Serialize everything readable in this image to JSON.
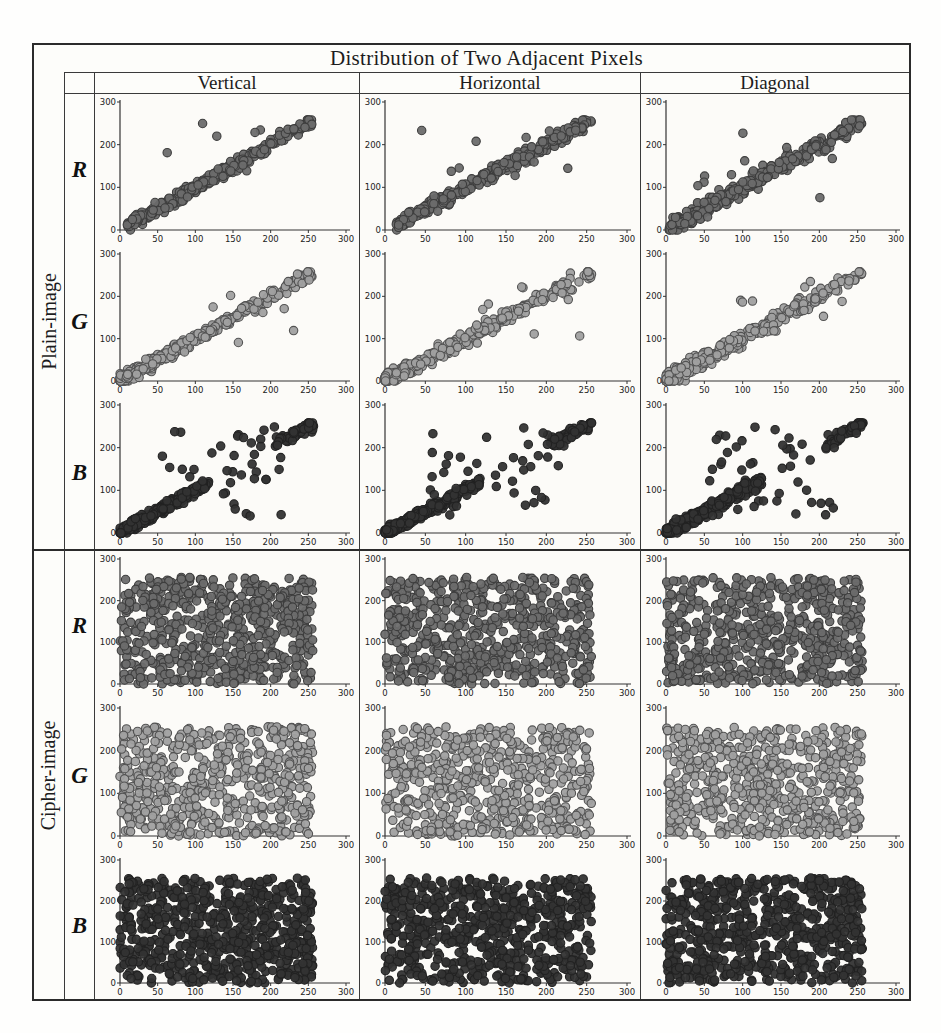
{
  "figure": {
    "title": "Distribution of Two Adjacent Pixels",
    "col_headers": [
      "Vertical",
      "Horizontal",
      "Diagonal"
    ],
    "row_groups": [
      {
        "label": "Plain-image",
        "channels": [
          "R",
          "G",
          "B"
        ]
      },
      {
        "label": "Cipher-image",
        "channels": [
          "R",
          "G",
          "B"
        ]
      }
    ]
  },
  "colors": {
    "R": {
      "fill": "#6b6b6b",
      "stroke": "#3d3d3d"
    },
    "G": {
      "fill": "#a0a0a0",
      "stroke": "#525252"
    },
    "B": {
      "fill": "#333333",
      "stroke": "#222222"
    },
    "axis": "#333333",
    "plot_bg": "#fcfbf8",
    "table_border": "#2b2b2b"
  },
  "chart_data": {
    "type": "scatter",
    "title": "Distribution of Two Adjacent Pixels",
    "xlabel": "",
    "ylabel": "",
    "xlim": [
      0,
      300
    ],
    "ylim": [
      0,
      300
    ],
    "xticks": [
      0,
      50,
      100,
      150,
      200,
      250,
      300
    ],
    "yticks": [
      0,
      100,
      200,
      300
    ],
    "data_value_range": [
      0,
      255
    ],
    "grid": false,
    "legend": "none",
    "marker_radius": 4.2,
    "layout": "6 rows (Plain-image R/G/B, Cipher-image R/G/B) x 3 columns (Vertical, Horizontal, Diagonal)",
    "subplots": [
      {
        "id": "plain-R-vertical",
        "group": "Plain-image",
        "channel": "R",
        "direction": "Vertical",
        "seed": 101,
        "components": [
          {
            "kind": "diag",
            "n": 310,
            "x0": 8,
            "x1": 256,
            "skew": 1.1,
            "sigma": 13
          },
          {
            "kind": "uniform",
            "n": 7,
            "x0": 40,
            "x1": 235,
            "y0": 80,
            "y1": 250
          }
        ]
      },
      {
        "id": "plain-R-horizontal",
        "group": "Plain-image",
        "channel": "R",
        "direction": "Horizontal",
        "seed": 102,
        "components": [
          {
            "kind": "diag",
            "n": 310,
            "x0": 14,
            "x1": 256,
            "skew": 1.1,
            "sigma": 14
          },
          {
            "kind": "uniform",
            "n": 10,
            "x0": 45,
            "x1": 240,
            "y0": 85,
            "y1": 255
          }
        ]
      },
      {
        "id": "plain-R-diagonal",
        "group": "Plain-image",
        "channel": "R",
        "direction": "Diagonal",
        "seed": 103,
        "components": [
          {
            "kind": "diag",
            "n": 320,
            "x0": 4,
            "x1": 256,
            "skew": 1.1,
            "sigma": 16
          },
          {
            "kind": "uniform",
            "n": 12,
            "x0": 30,
            "x1": 240,
            "y0": 60,
            "y1": 255
          }
        ]
      },
      {
        "id": "plain-G-vertical",
        "group": "Plain-image",
        "channel": "G",
        "direction": "Vertical",
        "seed": 104,
        "components": [
          {
            "kind": "diag",
            "n": 350,
            "x0": 0,
            "x1": 256,
            "skew": 1.85,
            "sigma": 13
          },
          {
            "kind": "uniform",
            "n": 7,
            "x0": 110,
            "x1": 245,
            "y0": 90,
            "y1": 235
          }
        ]
      },
      {
        "id": "plain-G-horizontal",
        "group": "Plain-image",
        "channel": "G",
        "direction": "Horizontal",
        "seed": 105,
        "components": [
          {
            "kind": "diag",
            "n": 350,
            "x0": 0,
            "x1": 256,
            "skew": 1.85,
            "sigma": 14
          },
          {
            "kind": "uniform",
            "n": 8,
            "x0": 100,
            "x1": 245,
            "y0": 90,
            "y1": 240
          }
        ]
      },
      {
        "id": "plain-G-diagonal",
        "group": "Plain-image",
        "channel": "G",
        "direction": "Diagonal",
        "seed": 106,
        "components": [
          {
            "kind": "diag",
            "n": 360,
            "x0": 0,
            "x1": 256,
            "skew": 1.85,
            "sigma": 16
          },
          {
            "kind": "uniform",
            "n": 10,
            "x0": 90,
            "x1": 245,
            "y0": 80,
            "y1": 240
          }
        ]
      },
      {
        "id": "plain-B-vertical",
        "group": "Plain-image",
        "channel": "B",
        "direction": "Vertical",
        "seed": 107,
        "components": [
          {
            "kind": "diag",
            "n": 300,
            "x0": 0,
            "x1": 118,
            "skew": 1.5,
            "sigma": 10
          },
          {
            "kind": "diag",
            "n": 55,
            "x0": 205,
            "x1": 257,
            "skew": 0.9,
            "sigma": 13
          },
          {
            "kind": "uniform",
            "n": 42,
            "x0": 55,
            "x1": 215,
            "y0": 40,
            "y1": 250
          }
        ]
      },
      {
        "id": "plain-B-horizontal",
        "group": "Plain-image",
        "channel": "B",
        "direction": "Horizontal",
        "seed": 108,
        "components": [
          {
            "kind": "diag",
            "n": 300,
            "x0": 0,
            "x1": 118,
            "skew": 1.5,
            "sigma": 10
          },
          {
            "kind": "diag",
            "n": 55,
            "x0": 205,
            "x1": 257,
            "skew": 0.9,
            "sigma": 13
          },
          {
            "kind": "uniform",
            "n": 40,
            "x0": 55,
            "x1": 215,
            "y0": 40,
            "y1": 250
          }
        ]
      },
      {
        "id": "plain-B-diagonal",
        "group": "Plain-image",
        "channel": "B",
        "direction": "Diagonal",
        "seed": 109,
        "components": [
          {
            "kind": "diag",
            "n": 320,
            "x0": 0,
            "x1": 125,
            "skew": 1.5,
            "sigma": 12
          },
          {
            "kind": "diag",
            "n": 55,
            "x0": 205,
            "x1": 257,
            "skew": 0.9,
            "sigma": 13
          },
          {
            "kind": "uniform",
            "n": 44,
            "x0": 55,
            "x1": 220,
            "y0": 40,
            "y1": 250
          }
        ]
      },
      {
        "id": "cipher-R-vertical",
        "group": "Cipher-image",
        "channel": "R",
        "direction": "Vertical",
        "seed": 110,
        "components": [
          {
            "kind": "uniform",
            "n": 620,
            "x0": 0,
            "x1": 256,
            "y0": 0,
            "y1": 256
          }
        ]
      },
      {
        "id": "cipher-R-horizontal",
        "group": "Cipher-image",
        "channel": "R",
        "direction": "Horizontal",
        "seed": 113,
        "components": [
          {
            "kind": "uniform",
            "n": 600,
            "x0": 0,
            "x1": 256,
            "y0": 0,
            "y1": 256
          }
        ]
      },
      {
        "id": "cipher-R-diagonal",
        "group": "Cipher-image",
        "channel": "R",
        "direction": "Diagonal",
        "seed": 116,
        "components": [
          {
            "kind": "uniform",
            "n": 600,
            "x0": 0,
            "x1": 256,
            "y0": 0,
            "y1": 256
          }
        ]
      },
      {
        "id": "cipher-G-vertical",
        "group": "Cipher-image",
        "channel": "G",
        "direction": "Vertical",
        "seed": 111,
        "components": [
          {
            "kind": "uniform",
            "n": 580,
            "x0": 0,
            "x1": 256,
            "y0": 0,
            "y1": 256
          }
        ]
      },
      {
        "id": "cipher-G-horizontal",
        "group": "Cipher-image",
        "channel": "G",
        "direction": "Horizontal",
        "seed": 114,
        "components": [
          {
            "kind": "uniform",
            "n": 570,
            "x0": 0,
            "x1": 256,
            "y0": 0,
            "y1": 256
          }
        ]
      },
      {
        "id": "cipher-G-diagonal",
        "group": "Cipher-image",
        "channel": "G",
        "direction": "Diagonal",
        "seed": 117,
        "components": [
          {
            "kind": "uniform",
            "n": 580,
            "x0": 0,
            "x1": 256,
            "y0": 0,
            "y1": 256
          }
        ]
      },
      {
        "id": "cipher-B-vertical",
        "group": "Cipher-image",
        "channel": "B",
        "direction": "Vertical",
        "seed": 112,
        "components": [
          {
            "kind": "uniform",
            "n": 660,
            "x0": 0,
            "x1": 256,
            "y0": 0,
            "y1": 256
          }
        ]
      },
      {
        "id": "cipher-B-horizontal",
        "group": "Cipher-image",
        "channel": "B",
        "direction": "Horizontal",
        "seed": 115,
        "components": [
          {
            "kind": "uniform",
            "n": 650,
            "x0": 0,
            "x1": 256,
            "y0": 0,
            "y1": 256
          }
        ]
      },
      {
        "id": "cipher-B-diagonal",
        "group": "Cipher-image",
        "channel": "B",
        "direction": "Diagonal",
        "seed": 118,
        "components": [
          {
            "kind": "uniform",
            "n": 660,
            "x0": 0,
            "x1": 256,
            "y0": 0,
            "y1": 256
          }
        ]
      }
    ]
  }
}
